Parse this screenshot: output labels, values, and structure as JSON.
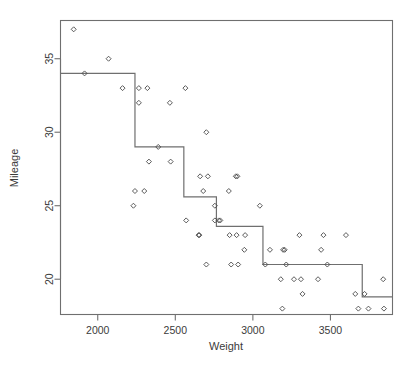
{
  "figure": {
    "background_color": "#ffffff",
    "frame_color": "#6f6f6f",
    "point_color": "#4a4a4a",
    "line_color": "#6f6f6f"
  },
  "chart_data": {
    "type": "scatter",
    "title": "",
    "xlabel": "Weight",
    "ylabel": "Mileage",
    "xlim": [
      1760,
      3900
    ],
    "ylim": [
      17.6,
      37.6
    ],
    "grid": false,
    "legend": null,
    "xticks": [
      2000,
      2500,
      3000,
      3500
    ],
    "xtick_labels": [
      "2000",
      "2500",
      "3000",
      "3500"
    ],
    "yticks": [
      20,
      25,
      30,
      35
    ],
    "ytick_labels": [
      "20",
      "25",
      "30",
      "35"
    ],
    "points": [
      [
        1845,
        37
      ],
      [
        1915,
        34
      ],
      [
        2070,
        35
      ],
      [
        2160,
        33
      ],
      [
        2265,
        33
      ],
      [
        2265,
        32
      ],
      [
        2320,
        33
      ],
      [
        2300,
        26
      ],
      [
        2240,
        26
      ],
      [
        2230,
        25
      ],
      [
        2330,
        28
      ],
      [
        2390,
        29
      ],
      [
        2465,
        32
      ],
      [
        2470,
        28
      ],
      [
        2565,
        33
      ],
      [
        2570,
        24
      ],
      [
        2650,
        23
      ],
      [
        2655,
        23
      ],
      [
        2660,
        27
      ],
      [
        2680,
        26
      ],
      [
        2700,
        30
      ],
      [
        2710,
        27
      ],
      [
        2700,
        21
      ],
      [
        2755,
        25
      ],
      [
        2755,
        24
      ],
      [
        2780,
        24
      ],
      [
        2790,
        24
      ],
      [
        2845,
        26
      ],
      [
        2850,
        23
      ],
      [
        2860,
        21
      ],
      [
        2890,
        27
      ],
      [
        2900,
        27
      ],
      [
        2895,
        23
      ],
      [
        2905,
        21
      ],
      [
        2950,
        23
      ],
      [
        2945,
        22
      ],
      [
        3045,
        25
      ],
      [
        3080,
        21
      ],
      [
        3110,
        22
      ],
      [
        3180,
        20
      ],
      [
        3190,
        18
      ],
      [
        3195,
        22
      ],
      [
        3205,
        22
      ],
      [
        3215,
        21
      ],
      [
        3265,
        20
      ],
      [
        3300,
        23
      ],
      [
        3310,
        20
      ],
      [
        3320,
        19
      ],
      [
        3420,
        20
      ],
      [
        3440,
        22
      ],
      [
        3455,
        23
      ],
      [
        3480,
        21
      ],
      [
        3600,
        23
      ],
      [
        3660,
        19
      ],
      [
        3680,
        18
      ],
      [
        3720,
        19
      ],
      [
        3745,
        18
      ],
      [
        3840,
        20
      ],
      [
        3845,
        18
      ]
    ],
    "step_function": {
      "name": "regression-tree-fit",
      "breakpoints": [
        1760,
        2240,
        2555,
        2700,
        2765,
        3065,
        3705,
        3900
      ],
      "levels": [
        34.0,
        29.0,
        29.0,
        25.6,
        24.0,
        23.6,
        21.0,
        18.8
      ],
      "segments": [
        {
          "x_start": 1760,
          "x_end": 2240,
          "y": 34.0
        },
        {
          "x_start": 2240,
          "x_end": 2555,
          "y": 29.0
        },
        {
          "x_start": 2555,
          "x_end": 2765,
          "y": 25.6
        },
        {
          "x_start": 2765,
          "x_end": 3065,
          "y": 23.6
        },
        {
          "x_start": 3065,
          "x_end": 3705,
          "y": 21.0
        },
        {
          "x_start": 3705,
          "x_end": 3900,
          "y": 18.8
        }
      ]
    }
  }
}
